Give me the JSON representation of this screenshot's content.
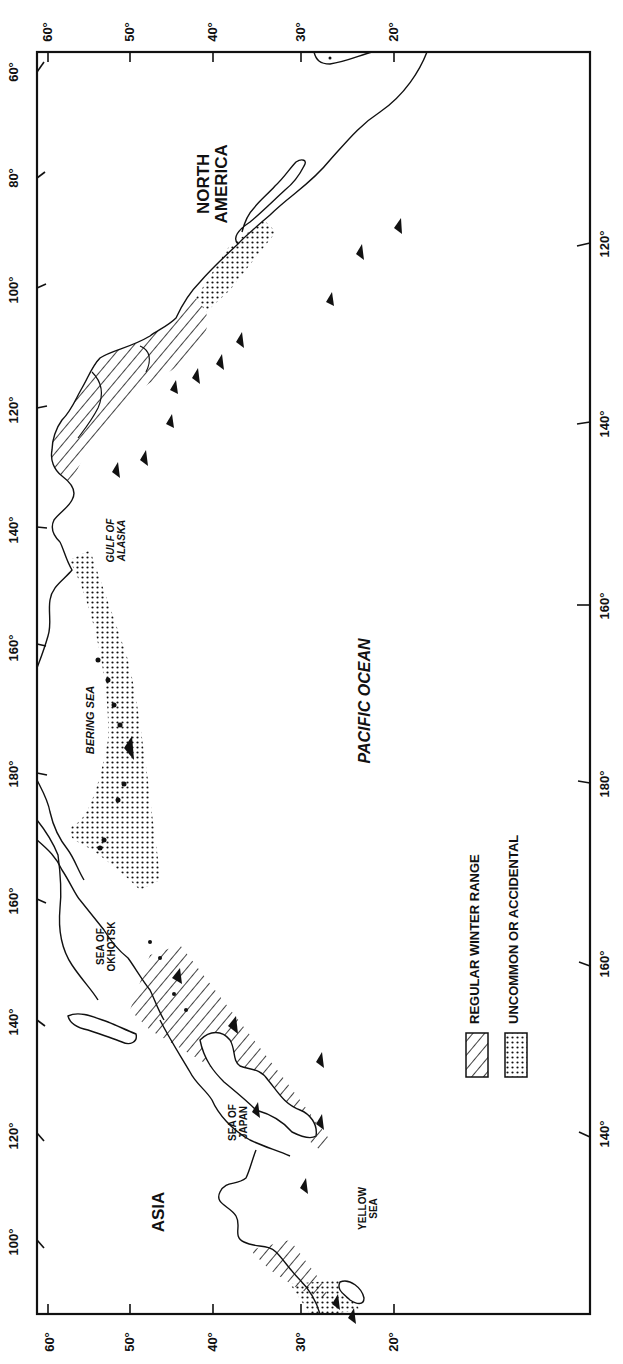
{
  "map": {
    "orientation": "rotated 90 degrees counter-clockwise",
    "axes": {
      "top_latitude_ticks": [
        "60°",
        "50°",
        "40°",
        "30°",
        "20°"
      ],
      "bottom_latitude_ticks": [
        "60°",
        "50°",
        "40°",
        "30°",
        "20°"
      ],
      "left_longitude_ticks": [
        "60°",
        "80°",
        "100°",
        "120°",
        "140°",
        "160°",
        "180°",
        "160°",
        "140°",
        "120°",
        "100°"
      ],
      "left_latitude_corner": "60°",
      "right_longitude_ticks": [
        "120°",
        "140°",
        "160°",
        "180°",
        "160°",
        "140°"
      ]
    },
    "labels": {
      "north_america_line1": "NORTH",
      "north_america_line2": "AMERICA",
      "gulf_of_alaska_line1": "GULF OF",
      "gulf_of_alaska_line2": "ALASKA",
      "bering_sea": "BERING SEA",
      "pacific_ocean": "PACIFIC OCEAN",
      "sea_of_okhotsk_line1": "SEA OF",
      "sea_of_okhotsk_line2": "OKHOTSK",
      "sea_of_japan_line1": "SEA OF",
      "sea_of_japan_line2": "JAPAN",
      "yellow_sea_line1": "YELLOW",
      "yellow_sea_line2": "SEA",
      "asia": "ASIA"
    },
    "legend": {
      "items": [
        {
          "pattern": "hatched",
          "label": "REGULAR WINTER RANGE"
        },
        {
          "pattern": "stippled",
          "label": "UNCOMMON OR ACCIDENTAL"
        }
      ]
    },
    "colors": {
      "ink": "#111111",
      "paper": "#ffffff"
    }
  }
}
